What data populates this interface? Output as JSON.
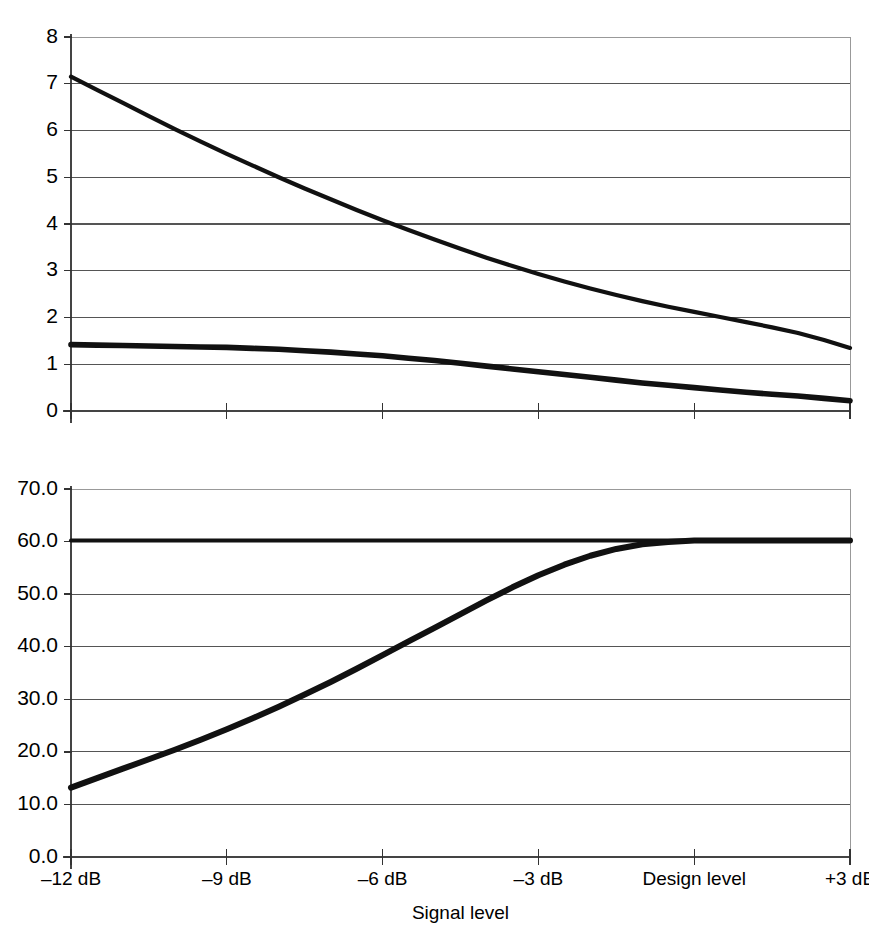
{
  "chart_data": [
    {
      "id": "top",
      "type": "line",
      "title": "",
      "xlabel": "",
      "ylabel": "",
      "xlim": [
        -12,
        3
      ],
      "ylim": [
        0,
        8
      ],
      "grid": true,
      "legend": "none",
      "xtick_values": [
        -12,
        -9,
        -6,
        -3,
        0,
        3
      ],
      "xtick_labels": [
        "–12 dB",
        "–9 dB",
        "–6 dB",
        "–3 dB",
        "Design level",
        "+3 dB"
      ],
      "ytick_values": [
        0,
        1,
        2,
        3,
        4,
        5,
        6,
        7,
        8
      ],
      "ytick_labels": [
        "0",
        "1",
        "2",
        "3",
        "4",
        "5",
        "6",
        "7",
        "8"
      ],
      "x": [
        -12,
        -11.5,
        -11,
        -10.5,
        -10,
        -9.5,
        -9,
        -8.5,
        -8,
        -7.5,
        -7,
        -6.5,
        -6,
        -5.5,
        -5,
        -4.5,
        -4,
        -3.5,
        -3,
        -2.5,
        -2,
        -1.5,
        -1,
        -0.5,
        0,
        0.5,
        1,
        1.5,
        2,
        2.5,
        3
      ],
      "series": [
        {
          "name": "upper-curve",
          "values": [
            7.15,
            6.87,
            6.59,
            6.31,
            6.03,
            5.76,
            5.5,
            5.25,
            5.0,
            4.76,
            4.53,
            4.3,
            4.08,
            3.87,
            3.67,
            3.47,
            3.28,
            3.1,
            2.93,
            2.77,
            2.62,
            2.48,
            2.35,
            2.23,
            2.12,
            2.01,
            1.9,
            1.79,
            1.67,
            1.52,
            1.35
          ]
        },
        {
          "name": "lower-curve",
          "values": [
            1.42,
            1.41,
            1.4,
            1.39,
            1.38,
            1.37,
            1.36,
            1.34,
            1.32,
            1.29,
            1.26,
            1.22,
            1.18,
            1.13,
            1.08,
            1.02,
            0.96,
            0.9,
            0.84,
            0.78,
            0.72,
            0.66,
            0.6,
            0.55,
            0.5,
            0.45,
            0.4,
            0.36,
            0.32,
            0.27,
            0.22
          ]
        }
      ]
    },
    {
      "id": "bottom",
      "type": "line",
      "title": "",
      "xlabel": "Signal level",
      "ylabel": "",
      "xlim": [
        -12,
        3
      ],
      "ylim": [
        0,
        70
      ],
      "grid": true,
      "legend": "none",
      "xtick_values": [
        -12,
        -9,
        -6,
        -3,
        0,
        3
      ],
      "xtick_labels": [
        "–12 dB",
        "–9 dB",
        "–6 dB",
        "–3 dB",
        "Design level",
        "+3 dB"
      ],
      "ytick_values": [
        0,
        10,
        20,
        30,
        40,
        50,
        60,
        70
      ],
      "ytick_labels": [
        "0.0",
        "10.0",
        "20.0",
        "30.0",
        "40.0",
        "50.0",
        "60.0",
        "70.0"
      ],
      "x": [
        -12,
        -11.5,
        -11,
        -10.5,
        -10,
        -9.5,
        -9,
        -8.5,
        -8,
        -7.5,
        -7,
        -6.5,
        -6,
        -5.5,
        -5,
        -4.5,
        -4,
        -3.5,
        -3,
        -2.5,
        -2,
        -1.5,
        -1,
        -0.5,
        0,
        0.5,
        1,
        1.5,
        2,
        2.5,
        3
      ],
      "series": [
        {
          "name": "flat-ceiling",
          "values": [
            60.2,
            60.2,
            60.2,
            60.2,
            60.2,
            60.2,
            60.2,
            60.2,
            60.2,
            60.2,
            60.2,
            60.2,
            60.2,
            60.2,
            60.2,
            60.2,
            60.2,
            60.2,
            60.2,
            60.2,
            60.2,
            60.2,
            60.2,
            60.2,
            60.2,
            60.2,
            60.2,
            60.2,
            60.2,
            60.2,
            60.2
          ]
        },
        {
          "name": "rising-s-curve",
          "values": [
            13.2,
            15.0,
            16.8,
            18.6,
            20.4,
            22.3,
            24.3,
            26.4,
            28.6,
            30.9,
            33.3,
            35.8,
            38.4,
            41.0,
            43.6,
            46.2,
            48.8,
            51.3,
            53.6,
            55.6,
            57.3,
            58.6,
            59.5,
            59.9,
            60.2,
            60.2,
            60.2,
            60.2,
            60.2,
            60.2,
            60.2
          ]
        }
      ]
    }
  ],
  "figure": {
    "shared_axis_label": "Signal level",
    "xtick_labels": [
      "–12 dB",
      "–9 dB",
      "–6 dB",
      "–3 dB",
      "Design level",
      "+3 dB"
    ],
    "top_ytick_labels": [
      "8",
      "7",
      "6",
      "5",
      "4",
      "3",
      "2",
      "1",
      "0"
    ],
    "bottom_ytick_labels": [
      "70.0",
      "60.0",
      "50.0",
      "40.0",
      "30.0",
      "20.0",
      "10.0",
      "0.0"
    ],
    "line_color": "#111111",
    "grid_color": "#555555",
    "background": "#ffffff"
  }
}
